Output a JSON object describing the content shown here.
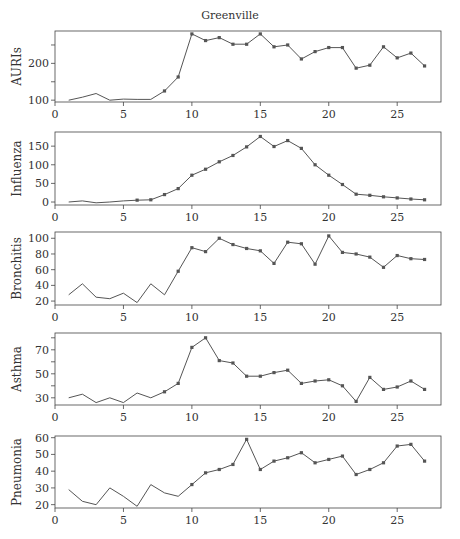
{
  "chart_data": {
    "type": "line",
    "title": "Greenville",
    "layout": "5 vertically stacked panels sharing x range",
    "grid": false,
    "legend": null,
    "colors": {
      "line": "#555555",
      "marker": "#555555",
      "axis": "#444444",
      "text": "#333333"
    },
    "x": [
      1,
      2,
      3,
      4,
      5,
      6,
      7,
      8,
      9,
      10,
      11,
      12,
      13,
      14,
      15,
      16,
      17,
      18,
      19,
      20,
      21,
      22,
      23,
      24,
      25,
      26,
      27
    ],
    "xlim": [
      0,
      28.2
    ],
    "xticks": [
      0,
      5,
      10,
      15,
      20,
      25
    ],
    "panels": [
      {
        "name": "AURIs",
        "ylabel": "AURIs",
        "ylim": [
          95,
          288
        ],
        "yticks": [
          100,
          150,
          200,
          250
        ],
        "ytick_labels": [
          "100",
          "",
          "200",
          ""
        ],
        "marker_start": 8,
        "values": [
          100,
          108,
          118,
          100,
          103,
          102,
          102,
          125,
          163,
          280,
          262,
          270,
          252,
          252,
          280,
          245,
          250,
          212,
          232,
          243,
          243,
          187,
          195,
          245,
          215,
          228,
          193
        ],
        "frame": {
          "top": 31,
          "bottom": 102
        }
      },
      {
        "name": "Influenza",
        "ylabel": "Influenza",
        "ylim": [
          -8,
          188
        ],
        "yticks": [
          0,
          50,
          100,
          150
        ],
        "ytick_labels": [
          "0",
          "50",
          "100",
          "150"
        ],
        "marker_start": 6,
        "values": [
          0,
          3,
          -2,
          0,
          3,
          5,
          6,
          20,
          36,
          72,
          88,
          108,
          125,
          148,
          176,
          149,
          165,
          144,
          100,
          72,
          47,
          21,
          18,
          14,
          11,
          8,
          6
        ],
        "frame": {
          "top": 132,
          "bottom": 205
        }
      },
      {
        "name": "Bronchitis",
        "ylabel": "Bronchitis",
        "ylim": [
          15,
          108
        ],
        "yticks": [
          20,
          40,
          60,
          80,
          100
        ],
        "ytick_labels": [
          "20",
          "40",
          "60",
          "80",
          "100"
        ],
        "marker_start": 9,
        "values": [
          28,
          42,
          25,
          23,
          30,
          18,
          42,
          28,
          58,
          88,
          83,
          100,
          92,
          87,
          84,
          68,
          95,
          93,
          67,
          103,
          82,
          80,
          76,
          63,
          78,
          74,
          73
        ],
        "frame": {
          "top": 232,
          "bottom": 305
        }
      },
      {
        "name": "Asthma",
        "ylabel": "Asthma",
        "ylim": [
          24,
          84
        ],
        "yticks": [
          30,
          40,
          50,
          60,
          70,
          80
        ],
        "ytick_labels": [
          "30",
          "",
          "50",
          "",
          "70",
          ""
        ],
        "marker_start": 8,
        "values": [
          30,
          33,
          26,
          30,
          26,
          34,
          30,
          35,
          42,
          72,
          80,
          61,
          59,
          48,
          48,
          51,
          53,
          42,
          44,
          45,
          40,
          27,
          47,
          37,
          39,
          44,
          37
        ],
        "frame": {
          "top": 333,
          "bottom": 405
        }
      },
      {
        "name": "Pneumonia",
        "ylabel": "Pneumonia",
        "ylim": [
          18,
          61
        ],
        "yticks": [
          20,
          30,
          40,
          50,
          60
        ],
        "ytick_labels": [
          "20",
          "30",
          "40",
          "50",
          "60"
        ],
        "marker_start": 10,
        "values": [
          29,
          22,
          20,
          30,
          25,
          19,
          32,
          27,
          25,
          32,
          39,
          41,
          44,
          59,
          41,
          46,
          48,
          51,
          45,
          47,
          49,
          38,
          41,
          45,
          55,
          56,
          46
        ],
        "frame": {
          "top": 436,
          "bottom": 508
        }
      }
    ]
  }
}
